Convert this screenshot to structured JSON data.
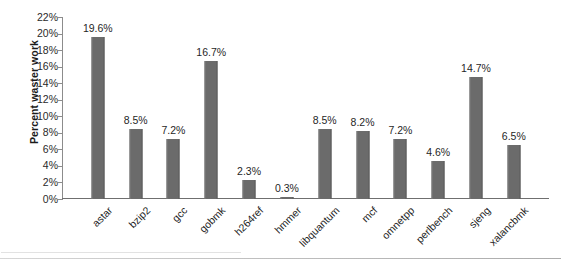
{
  "chart_data": {
    "type": "bar",
    "title": "",
    "xlabel": "",
    "ylabel": "Percent waster work",
    "ylim": [
      0,
      22
    ],
    "ytick_step": 2,
    "grid": false,
    "legend": false,
    "bar_color": "#6b6b6b",
    "axis_color": "#6f6f6f",
    "categories": [
      "astar",
      "bzip2",
      "gcc",
      "gobmk",
      "h264ref",
      "hmmer",
      "libquantum",
      "mcf",
      "omnetpp",
      "perlbench",
      "sjeng",
      "xalancbmk"
    ],
    "values": [
      19.6,
      8.5,
      7.2,
      16.7,
      2.3,
      0.3,
      8.5,
      8.2,
      7.2,
      4.6,
      14.7,
      6.5
    ],
    "data_labels": [
      "19.6%",
      "8.5%",
      "7.2%",
      "16.7%",
      "2.3%",
      "0.3%",
      "8.5%",
      "8.2%",
      "7.2%",
      "4.6%",
      "14.7%",
      "6.5%"
    ],
    "ytick_labels": [
      "22%",
      "20%",
      "18%",
      "16%",
      "14%",
      "12%",
      "10%",
      "8%",
      "6%",
      "4%",
      "2%",
      "0%"
    ],
    "ytick_values": [
      22,
      20,
      18,
      16,
      14,
      12,
      10,
      8,
      6,
      4,
      2,
      0
    ]
  }
}
